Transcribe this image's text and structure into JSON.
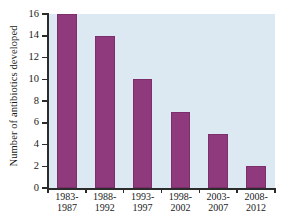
{
  "chart_data": {
    "type": "bar",
    "title": "",
    "xlabel": "",
    "ylabel": "Number of antibiotics developed",
    "categories": [
      "1983-\n1987",
      "1988-\n1992",
      "1993-\n1997",
      "1998-\n2002",
      "2003-\n2007",
      "2008-\n2012"
    ],
    "category_lines": [
      [
        "1983-",
        "1987"
      ],
      [
        "1988-",
        "1992"
      ],
      [
        "1993-",
        "1997"
      ],
      [
        "1998-",
        "2002"
      ],
      [
        "2003-",
        "2007"
      ],
      [
        "2008-",
        "2012"
      ]
    ],
    "values": [
      16,
      14,
      10,
      7,
      5,
      2
    ],
    "ylim": [
      0,
      16
    ],
    "y_ticks": [
      0,
      2,
      4,
      6,
      8,
      10,
      12,
      14,
      16
    ],
    "y_tick_labels": [
      "0",
      "2",
      "4",
      "6",
      "8",
      "10",
      "12",
      "14",
      "16"
    ],
    "grid": false,
    "legend": null,
    "colors": {
      "bar": "#8e3a7c",
      "plot_background": "#dce9f2",
      "page_background": "#ffffff",
      "axis": "#2b2b2b",
      "text": "#1a1a1a"
    }
  }
}
